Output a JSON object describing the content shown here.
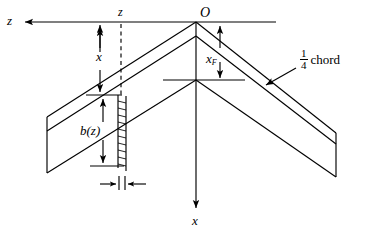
{
  "figure": {
    "type": "engineering-diagram"
  },
  "labels": {
    "z_axis": "z",
    "z_dim": "z",
    "x_dim": "x",
    "chord_local": "b(z)",
    "origin": "O",
    "x_forward": "x",
    "x_forward_sub": "F",
    "x_axis": "x",
    "quarter_numerator": "1",
    "quarter_denominator": "4",
    "chord_word": "chord"
  },
  "colors": {
    "line": "#000000",
    "background": "#ffffff"
  },
  "geometry": {
    "origin_px": [
      196,
      22
    ],
    "z_axis_y": 22,
    "z_axis_arrow_x": 22,
    "x_axis_arrow_y": 211,
    "strip_x_px": [
      118,
      126
    ],
    "dashed_line_x": 121,
    "left_tip_x": 47,
    "right_tip_x": 336
  }
}
